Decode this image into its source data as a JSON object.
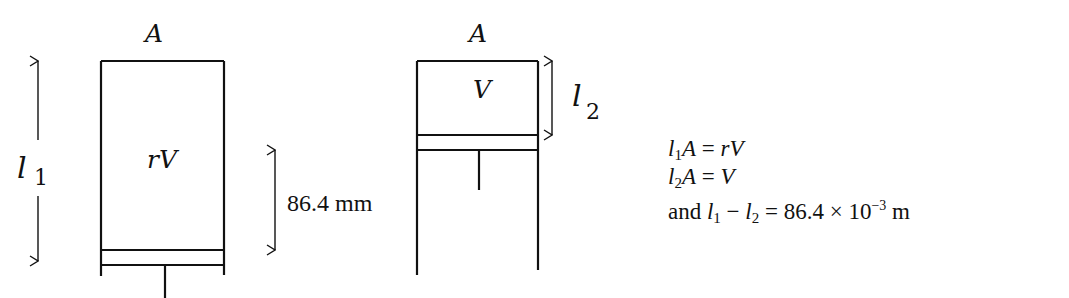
{
  "diagram": {
    "left_cylinder": {
      "top_label": "A",
      "content_label": "rV",
      "length_label_var": "l",
      "length_label_sub": "1"
    },
    "right_cylinder": {
      "top_label": "A",
      "content_label": "V",
      "length_label_var": "l",
      "length_label_sub": "2"
    },
    "displacement_label": "86.4 mm"
  },
  "equations": [
    {
      "prefix": "",
      "lhs_var": "l",
      "lhs_sub": "1",
      "lhs_rest": "A",
      "op": " = ",
      "rhs": "rV"
    },
    {
      "prefix": "",
      "lhs_var": "l",
      "lhs_sub": "2",
      "lhs_rest": "A",
      "op": " = ",
      "rhs": "V"
    },
    {
      "prefix": "and ",
      "a_var": "l",
      "a_sub": "1",
      "minus": " − ",
      "b_var": "l",
      "b_sub": "2",
      "op": " = ",
      "value": "86.4 × 10",
      "exp": "−3",
      "unit": " m"
    }
  ]
}
